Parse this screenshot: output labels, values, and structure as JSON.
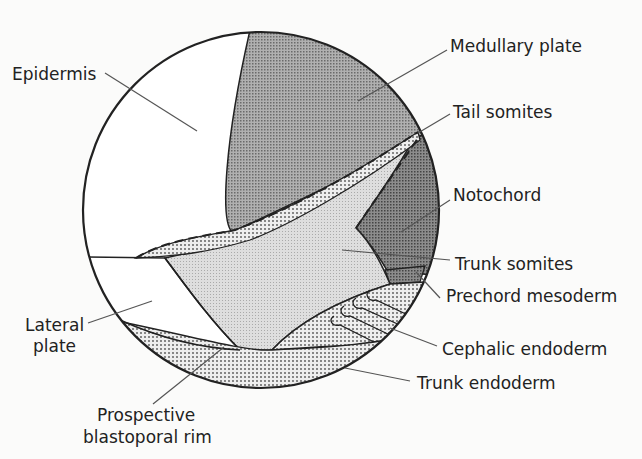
{
  "diagram": {
    "labels": {
      "epidermis": "Epidermis",
      "medullary_plate": "Medullary plate",
      "tail_somites": "Tail somites",
      "notochord": "Notochord",
      "trunk_somites": "Trunk  somites",
      "prechord_mesoderm": "Prechord mesoderm",
      "cephalic_endoderm": "Cephalic endoderm",
      "trunk_endoderm": "Trunk endoderm",
      "lateral_plate_1": "Lateral",
      "lateral_plate_2": "plate",
      "blastoporal_rim_1": "Prospective",
      "blastoporal_rim_2": "blastoporal rim"
    },
    "colors": {
      "background": "#fbfbfa",
      "epidermis": "#ffffff",
      "medullary_plate": "#a8a8a8",
      "notochord": "#8a8a8a",
      "trunk_somites": "#d8d8d8",
      "stipple": "#e6e6e6",
      "outline": "#222222"
    }
  }
}
